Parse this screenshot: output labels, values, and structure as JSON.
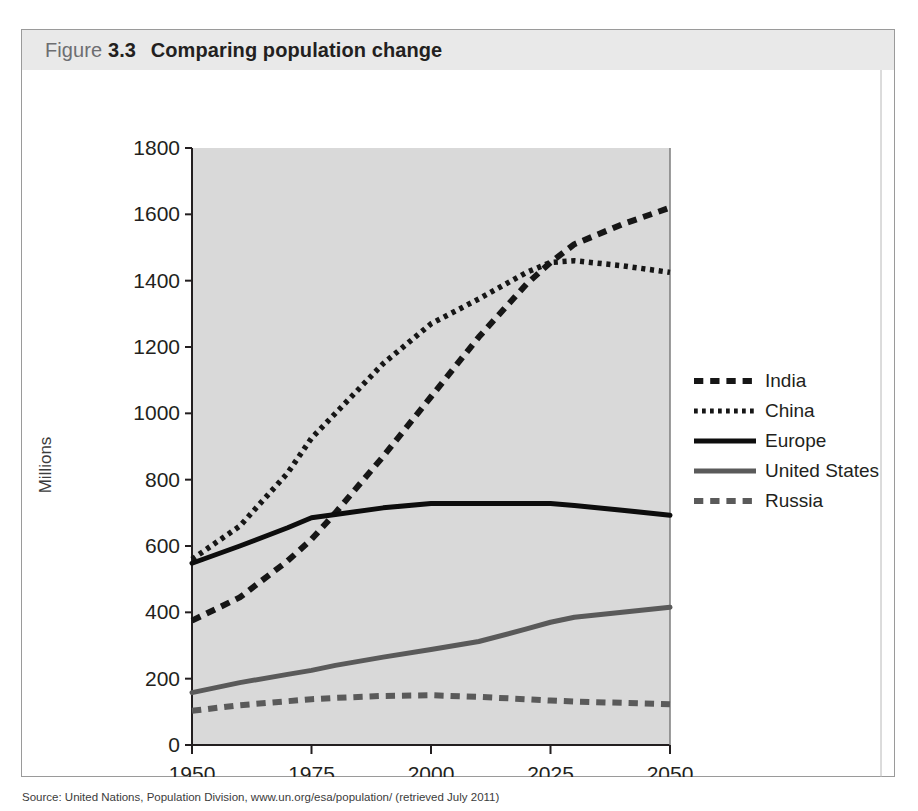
{
  "figure": {
    "label": "Figure",
    "number": "3.3",
    "title": "Comparing population change"
  },
  "caption": "Source: United Nations, Population Division, www.un.org/esa/population/ (retrieved July 2011)",
  "colors": {
    "plot_background": "#d9d9d9",
    "header_background": "#e9e9e9",
    "axis": "#231f20",
    "india": "#161616",
    "china": "#161616",
    "europe": "#0d0d0d",
    "united_states": "#5a5a5a",
    "russia": "#5a5a5a"
  },
  "chart_data": {
    "type": "line",
    "title": "Comparing population change",
    "xlabel": "",
    "ylabel": "Millions",
    "xlim": [
      1950,
      2050
    ],
    "ylim": [
      0,
      1800
    ],
    "xticks": [
      1950,
      1975,
      2000,
      2025,
      2050
    ],
    "yticks": [
      0,
      200,
      400,
      600,
      800,
      1000,
      1200,
      1400,
      1600,
      1800
    ],
    "grid": false,
    "legend_position": "right",
    "x": [
      1950,
      1960,
      1970,
      1975,
      1980,
      1990,
      2000,
      2010,
      2020,
      2025,
      2030,
      2040,
      2050
    ],
    "series": [
      {
        "name": "India",
        "style": "dashed",
        "color": "#161616",
        "values": [
          375,
          445,
          555,
          620,
          700,
          870,
          1050,
          1230,
          1390,
          1455,
          1510,
          1570,
          1620
        ]
      },
      {
        "name": "China",
        "style": "dotted",
        "color": "#161616",
        "values": [
          560,
          660,
          820,
          925,
          1000,
          1150,
          1270,
          1345,
          1425,
          1455,
          1460,
          1445,
          1425
        ]
      },
      {
        "name": "Europe",
        "style": "solid",
        "color": "#0d0d0d",
        "values": [
          548,
          600,
          655,
          685,
          695,
          715,
          728,
          728,
          728,
          728,
          722,
          708,
          693
        ]
      },
      {
        "name": "United States",
        "style": "solid",
        "color": "#5a5a5a",
        "values": [
          158,
          188,
          213,
          225,
          240,
          265,
          288,
          312,
          350,
          370,
          385,
          400,
          415
        ]
      },
      {
        "name": "Russia",
        "style": "dashed",
        "color": "#5a5a5a",
        "values": [
          103,
          120,
          132,
          138,
          142,
          148,
          150,
          145,
          138,
          134,
          131,
          127,
          123
        ]
      }
    ]
  },
  "legend": {
    "items": [
      {
        "label": "India",
        "style": "dashed",
        "color": "#161616"
      },
      {
        "label": "China",
        "style": "dotted",
        "color": "#161616"
      },
      {
        "label": "Europe",
        "style": "solid",
        "color": "#0d0d0d"
      },
      {
        "label": "United States",
        "style": "solid",
        "color": "#5a5a5a"
      },
      {
        "label": "Russia",
        "style": "dashed",
        "color": "#5a5a5a"
      }
    ]
  }
}
